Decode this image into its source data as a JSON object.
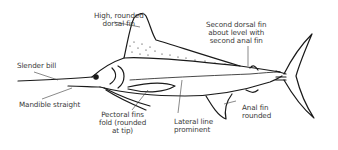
{
  "diagram": {
    "colors": {
      "outline": "#1a1a1a",
      "text": "#3a3a3a",
      "background": "#ffffff"
    },
    "labels": [
      {
        "id": "dorsal",
        "lines": [
          "High, rounded",
          "dorsal fin"
        ]
      },
      {
        "id": "second-dorsal",
        "lines": [
          "Second dorsal fin",
          "about level with",
          "second anal fin"
        ]
      },
      {
        "id": "bill",
        "lines": [
          "Slender bill"
        ]
      },
      {
        "id": "mandible",
        "lines": [
          "Mandible straight"
        ]
      },
      {
        "id": "pectoral",
        "lines": [
          "Pectoral fins",
          "fold (rounded",
          "at tip)"
        ]
      },
      {
        "id": "lateral",
        "lines": [
          "Lateral line",
          "prominent"
        ]
      },
      {
        "id": "anal",
        "lines": [
          "Anal fin",
          "rounded"
        ]
      }
    ]
  }
}
